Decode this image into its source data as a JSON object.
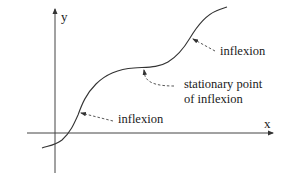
{
  "figure": {
    "axes": {
      "x_label": "x",
      "y_label": "y"
    },
    "annotations": [
      {
        "id": "lower",
        "text": "inflexion"
      },
      {
        "id": "upper",
        "text": "inflexion"
      },
      {
        "id": "stationary",
        "lines": [
          "stationary point",
          "of inflexion"
        ]
      }
    ],
    "colors": {
      "stroke": "#333333",
      "text": "#1a1a1a",
      "background": "#ffffff"
    }
  }
}
